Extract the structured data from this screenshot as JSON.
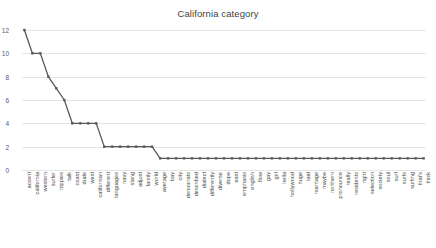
{
  "chart_data": {
    "type": "line",
    "title": "California category",
    "xlabel": "",
    "ylabel": "",
    "ylim": [
      0,
      12
    ],
    "yticks": [
      0,
      2,
      4,
      6,
      8,
      10,
      12
    ],
    "grid": true,
    "legend": false,
    "legend_position": "none",
    "marker": "square",
    "line_color": "#595959",
    "marker_color": "#595959",
    "grid_color": "#e4e4e4",
    "categories": [
      "accent",
      "california",
      "western",
      "surfer",
      "hippies",
      "talk",
      "coast",
      "dude",
      "west",
      "californian",
      "different",
      "languages",
      "navy",
      "slang",
      "adjust",
      "family",
      "world",
      "average",
      "bay",
      "city",
      "democrats",
      "described",
      "dialect",
      "differently",
      "diverse",
      "dope",
      "east",
      "emphasis",
      "english",
      "flow",
      "gay",
      "girl",
      "hella",
      "hollywood",
      "huge",
      "laid",
      "marriage",
      "maybe",
      "northern",
      "pronounce",
      "really",
      "residents",
      "right",
      "selection",
      "society",
      "soul",
      "surf",
      "surfs",
      "surfing",
      "that's",
      "thick"
    ],
    "values": [
      12,
      10,
      10,
      8,
      7,
      6,
      4,
      4,
      4,
      4,
      2,
      2,
      2,
      2,
      2,
      2,
      2,
      1,
      1,
      1,
      1,
      1,
      1,
      1,
      1,
      1,
      1,
      1,
      1,
      1,
      1,
      1,
      1,
      1,
      1,
      1,
      1,
      1,
      1,
      1,
      1,
      1,
      1,
      1,
      1,
      1,
      1,
      1,
      1,
      1,
      1
    ]
  }
}
